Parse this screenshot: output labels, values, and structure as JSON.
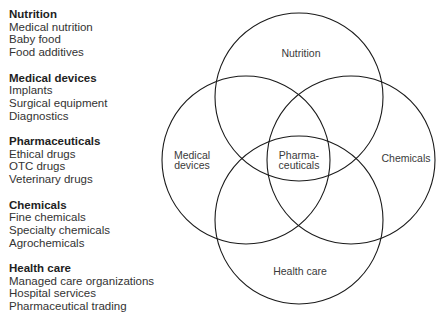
{
  "legend": {
    "groups": [
      {
        "title": "Nutrition",
        "items": [
          "Medical nutrition",
          "Baby food",
          "Food additives"
        ]
      },
      {
        "title": "Medical devices",
        "items": [
          "Implants",
          "Surgical equipment",
          "Diagnostics"
        ]
      },
      {
        "title": "Pharmaceuticals",
        "items": [
          "Ethical drugs",
          "OTC drugs",
          "Veterinary drugs"
        ]
      },
      {
        "title": "Chemicals",
        "items": [
          "Fine chemicals",
          "Specialty chemicals",
          "Agrochemicals"
        ]
      },
      {
        "title": "Health care",
        "items": [
          "Managed care organizations",
          "Hospital services",
          "Pharmaceutical trading"
        ]
      }
    ]
  },
  "venn": {
    "circles": [
      {
        "name": "Nutrition",
        "label": "Nutrition"
      },
      {
        "name": "Medical devices",
        "label_line1": "Medical",
        "label_line2": "devices"
      },
      {
        "name": "Chemicals",
        "label": "Chemicals"
      },
      {
        "name": "Health care",
        "label": "Health care"
      }
    ],
    "center": {
      "label_line1": "Pharma-",
      "label_line2": "ceuticals"
    },
    "stroke_color": "#1a1a1a"
  }
}
